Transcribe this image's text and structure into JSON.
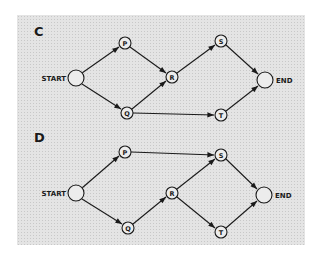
{
  "diagrams": [
    {
      "id": "C",
      "title": "C",
      "nodes": {
        "start": {
          "label": "START",
          "x": 76,
          "y": 78,
          "r": 8
        },
        "p": {
          "label": "P",
          "x": 125,
          "y": 43,
          "r": 6
        },
        "q": {
          "label": "Q",
          "x": 127,
          "y": 113,
          "r": 6
        },
        "r": {
          "label": "R",
          "x": 172,
          "y": 77,
          "r": 6
        },
        "s": {
          "label": "S",
          "x": 221,
          "y": 41,
          "r": 6
        },
        "t": {
          "label": "T",
          "x": 221,
          "y": 115,
          "r": 6
        },
        "end": {
          "label": "END",
          "x": 265,
          "y": 80,
          "r": 8
        }
      },
      "edges": [
        [
          "START",
          "P"
        ],
        [
          "START",
          "Q"
        ],
        [
          "P",
          "R"
        ],
        [
          "Q",
          "R"
        ],
        [
          "R",
          "S"
        ],
        [
          "Q",
          "T"
        ],
        [
          "S",
          "END"
        ],
        [
          "T",
          "END"
        ]
      ]
    },
    {
      "id": "D",
      "title": "D",
      "nodes": {
        "start": {
          "label": "START",
          "x": 76,
          "y": 193,
          "r": 8
        },
        "p": {
          "label": "P",
          "x": 125,
          "y": 152,
          "r": 6
        },
        "q": {
          "label": "Q",
          "x": 128,
          "y": 228,
          "r": 6
        },
        "r": {
          "label": "R",
          "x": 172,
          "y": 193,
          "r": 6
        },
        "s": {
          "label": "S",
          "x": 221,
          "y": 155,
          "r": 6
        },
        "t": {
          "label": "T",
          "x": 221,
          "y": 232,
          "r": 6
        },
        "end": {
          "label": "END",
          "x": 264,
          "y": 195,
          "r": 8
        }
      },
      "edges": [
        [
          "START",
          "P"
        ],
        [
          "START",
          "Q"
        ],
        [
          "P",
          "S"
        ],
        [
          "Q",
          "R"
        ],
        [
          "R",
          "S"
        ],
        [
          "R",
          "T"
        ],
        [
          "S",
          "END"
        ],
        [
          "T",
          "END"
        ]
      ]
    }
  ],
  "colors": {
    "line": "#1a1a1a",
    "panel": "#e4e4e4",
    "node_fill": "#ececec"
  }
}
